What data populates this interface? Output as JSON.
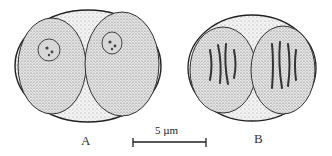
{
  "figure": {
    "panels": [
      {
        "label": "A",
        "description": "two-celled spore/cell pair with round nuclei"
      },
      {
        "label": "B",
        "description": "two-celled pair with chromosomes in division"
      }
    ],
    "scale_bar": {
      "text": "5 µm"
    }
  }
}
